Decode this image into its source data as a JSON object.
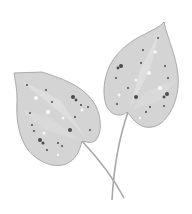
{
  "illustration": {
    "subject": "two spotted leaves with crossing stems",
    "colors": {
      "background": "#ffffff",
      "leaf_fill": "#d4d4d4",
      "leaf_light": "#e2e2e2",
      "leaf_outline": "#9a9a9a",
      "stem": "#a8a8a8",
      "spot_dark": "#4a4a4a",
      "spot_light": "#f6f6f6"
    }
  }
}
